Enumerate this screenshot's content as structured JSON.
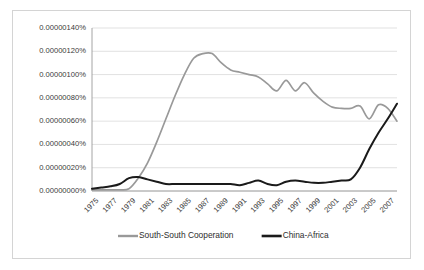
{
  "chart_data": {
    "type": "line",
    "title": "",
    "xlabel": "",
    "ylabel": "",
    "x": [
      1975,
      1976,
      1977,
      1978,
      1979,
      1980,
      1981,
      1982,
      1983,
      1984,
      1985,
      1986,
      1987,
      1988,
      1989,
      1990,
      1991,
      1992,
      1993,
      1994,
      1995,
      1996,
      1997,
      1998,
      1999,
      2000,
      2001,
      2002,
      2003,
      2004,
      2005,
      2006,
      2007,
      2008
    ],
    "xlim": [
      1975,
      2008
    ],
    "ylim": [
      0,
      1.4e-06
    ],
    "grid": true,
    "legend_position": "bottom",
    "ytick_labels": [
      "0.00000000%",
      "0.00000020%",
      "0.00000040%",
      "0.00000060%",
      "0.00000080%",
      "0.00000100%",
      "0.00000120%",
      "0.00000140%"
    ],
    "ytick_values": [
      0,
      20,
      40,
      60,
      80,
      100,
      120,
      140
    ],
    "xtick_labels": [
      "1975",
      "1977",
      "1979",
      "1981",
      "1983",
      "1985",
      "1987",
      "1989",
      "1991",
      "1993",
      "1995",
      "1997",
      "1999",
      "2001",
      "2003",
      "2005",
      "2007"
    ],
    "xtick_values": [
      1975,
      1977,
      1979,
      1981,
      1983,
      1985,
      1987,
      1989,
      1991,
      1993,
      1995,
      1997,
      1999,
      2001,
      2003,
      2005,
      2007
    ],
    "series": [
      {
        "name": "South-South Cooperation",
        "color": "#999999",
        "width": 1.7,
        "values": [
          1,
          1,
          1,
          1,
          2,
          11,
          24,
          42,
          62,
          82,
          100,
          114,
          118,
          118,
          110,
          104,
          102,
          100,
          98,
          92,
          86,
          95,
          86,
          93,
          84,
          77,
          72,
          71,
          71,
          73,
          62,
          74,
          71,
          60
        ]
      },
      {
        "name": "China-Africa",
        "color": "#1a1a1a",
        "width": 2.0,
        "values": [
          2,
          3,
          4,
          6,
          11,
          12,
          10,
          8,
          6,
          6,
          6,
          6,
          6,
          6,
          6,
          6,
          5,
          7,
          9,
          6,
          5,
          8,
          9,
          8,
          7,
          7,
          8,
          9,
          10,
          20,
          36,
          50,
          62,
          75
        ]
      }
    ]
  },
  "legend": {
    "items": [
      {
        "label": "South-South Cooperation",
        "color": "#999999",
        "width": 2.4
      },
      {
        "label": "China-Africa",
        "color": "#1a1a1a",
        "width": 2.6
      }
    ]
  }
}
